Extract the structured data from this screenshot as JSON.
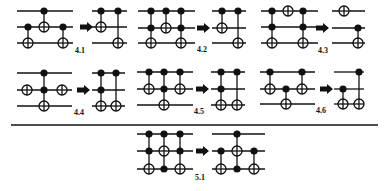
{
  "diagram": {
    "type": "quantum-circuit-identities",
    "colors": {
      "ink": "#111111",
      "background": "#ffffff"
    },
    "divider": {
      "x1": 11,
      "x2": 378,
      "y": 125
    },
    "identities": [
      {
        "id": "4.1",
        "label": "4.1",
        "label_pos": [
          75,
          53
        ],
        "arrow": {
          "x": 80,
          "y": 27
        },
        "lhs": {
          "x1": 17,
          "x2": 73,
          "wires": [
            11,
            27,
            43
          ],
          "gates": [
            {
              "x": 28,
              "controls": [
                27
              ],
              "targets": [
                43
              ],
              "nots": []
            },
            {
              "x": 44,
              "controls": [
                11
              ],
              "targets": [
                27
              ],
              "nots": []
            },
            {
              "x": 63,
              "controls": [
                27
              ],
              "targets": [
                43
              ],
              "nots": []
            }
          ]
        },
        "rhs": {
          "x1": 92,
          "x2": 127,
          "wires": [
            11,
            27,
            43
          ],
          "gates": [
            {
              "x": 101,
              "controls": [
                11
              ],
              "targets": [
                27
              ],
              "nots": []
            },
            {
              "x": 118,
              "controls": [
                11
              ],
              "targets": [
                43
              ],
              "nots": []
            }
          ]
        }
      },
      {
        "id": "4.2",
        "label": "4.2",
        "label_pos": [
          197,
          52
        ],
        "arrow": {
          "x": 197,
          "y": 28
        },
        "lhs": {
          "x1": 138,
          "x2": 195,
          "wires": [
            11,
            28,
            43
          ],
          "gates": [
            {
              "x": 151,
              "controls": [
                11,
                28
              ],
              "targets": [
                43
              ],
              "nots": []
            },
            {
              "x": 166,
              "controls": [
                11
              ],
              "targets": [
                28
              ],
              "nots": []
            },
            {
              "x": 181,
              "controls": [
                11,
                28
              ],
              "targets": [
                43
              ],
              "nots": []
            }
          ]
        },
        "rhs": {
          "x1": 212,
          "x2": 246,
          "wires": [
            11,
            28,
            43
          ],
          "gates": [
            {
              "x": 222,
              "controls": [
                11
              ],
              "targets": [
                28
              ],
              "nots": []
            },
            {
              "x": 238,
              "controls": [
                11
              ],
              "targets": [
                43
              ],
              "nots": []
            }
          ]
        }
      },
      {
        "id": "4.3",
        "label": "4.3",
        "label_pos": [
          318,
          53
        ],
        "arrow": {
          "x": 316,
          "y": 28
        },
        "lhs": {
          "x1": 261,
          "x2": 318,
          "wires": [
            11,
            27,
            43
          ],
          "gates": [
            {
              "x": 272,
              "controls": [
                11,
                27
              ],
              "targets": [
                43
              ],
              "nots": []
            },
            {
              "x": 288,
              "controls": [],
              "targets": [],
              "nots": [
                11
              ]
            },
            {
              "x": 303,
              "controls": [
                11,
                27
              ],
              "targets": [
                43
              ],
              "nots": []
            }
          ]
        },
        "rhs": {
          "x1": 332,
          "x2": 365,
          "wires": [
            11,
            28,
            43
          ],
          "gates": [
            {
              "x": 344,
              "controls": [],
              "targets": [],
              "nots": [
                11
              ]
            },
            {
              "x": 358,
              "controls": [
                28
              ],
              "targets": [
                43
              ],
              "nots": []
            }
          ]
        }
      },
      {
        "id": "4.4",
        "label": "4.4",
        "label_pos": [
          74,
          115
        ],
        "arrow": {
          "x": 77,
          "y": 90
        },
        "lhs": {
          "x1": 17,
          "x2": 72,
          "wires": [
            73,
            90,
            106
          ],
          "gates": [
            {
              "x": 27,
              "controls": [],
              "targets": [],
              "nots": [
                90
              ]
            },
            {
              "x": 44,
              "controls": [
                73,
                90
              ],
              "targets": [
                106
              ],
              "nots": []
            },
            {
              "x": 62,
              "controls": [],
              "targets": [],
              "nots": [
                90
              ]
            }
          ]
        },
        "rhs": {
          "x1": 92,
          "x2": 125,
          "wires": [
            73,
            90,
            106
          ],
          "gates": [
            {
              "x": 101,
              "controls": [
                73,
                90
              ],
              "targets": [
                106
              ],
              "nots": []
            },
            {
              "x": 116,
              "controls": [
                73
              ],
              "targets": [
                106
              ],
              "nots": []
            }
          ]
        }
      },
      {
        "id": "4.5",
        "label": "4.5",
        "label_pos": [
          194,
          114
        ],
        "arrow": {
          "x": 196,
          "y": 89
        },
        "lhs": {
          "x1": 137,
          "x2": 193,
          "wires": [
            72,
            89,
            105
          ],
          "gates": [
            {
              "x": 149,
              "controls": [
                72
              ],
              "targets": [
                89
              ],
              "nots": []
            },
            {
              "x": 164,
              "controls": [
                72,
                89
              ],
              "targets": [
                105
              ],
              "nots": []
            },
            {
              "x": 180,
              "controls": [
                72
              ],
              "targets": [
                89
              ],
              "nots": []
            }
          ]
        },
        "rhs": {
          "x1": 211,
          "x2": 245,
          "wires": [
            72,
            89,
            105
          ],
          "gates": [
            {
              "x": 221,
              "controls": [
                72,
                89
              ],
              "targets": [
                105
              ],
              "nots": []
            },
            {
              "x": 237,
              "controls": [
                72
              ],
              "targets": [
                105
              ],
              "nots": []
            }
          ]
        }
      },
      {
        "id": "4.6",
        "label": "4.6",
        "label_pos": [
          316,
          113
        ],
        "arrow": {
          "x": 320,
          "y": 89
        },
        "lhs": {
          "x1": 260,
          "x2": 315,
          "wires": [
            72,
            89,
            104
          ],
          "gates": [
            {
              "x": 270,
              "controls": [
                72
              ],
              "targets": [
                89
              ],
              "nots": []
            },
            {
              "x": 286,
              "controls": [
                89
              ],
              "targets": [
                104
              ],
              "nots": []
            },
            {
              "x": 302,
              "controls": [
                72
              ],
              "targets": [
                89
              ],
              "nots": []
            }
          ]
        },
        "rhs": {
          "x1": 334,
          "x2": 364,
          "wires": [
            72,
            89,
            104
          ],
          "gates": [
            {
              "x": 343,
              "controls": [
                89
              ],
              "targets": [
                104
              ],
              "nots": []
            },
            {
              "x": 359,
              "controls": [
                72
              ],
              "targets": [
                104
              ],
              "nots": []
            }
          ]
        }
      },
      {
        "id": "5.1",
        "label": "5.1",
        "label_pos": [
          195,
          180
        ],
        "arrow": {
          "x": 196,
          "y": 151
        },
        "lhs": {
          "x1": 137,
          "x2": 193,
          "wires": [
            134,
            151,
            169
          ],
          "gates": [
            {
              "x": 149,
              "controls": [
                134,
                151
              ],
              "targets": [
                169
              ],
              "nots": []
            },
            {
              "x": 164,
              "controls": [
                134,
                169
              ],
              "targets": [
                151
              ],
              "nots": []
            },
            {
              "x": 180,
              "controls": [
                134,
                151
              ],
              "targets": [
                169
              ],
              "nots": []
            }
          ]
        },
        "rhs": {
          "x1": 212,
          "x2": 265,
          "wires": [
            134,
            151,
            169
          ],
          "gates": [
            {
              "x": 221,
              "controls": [
                151
              ],
              "targets": [
                169
              ],
              "nots": []
            },
            {
              "x": 237,
              "controls": [
                134,
                169
              ],
              "targets": [
                151
              ],
              "nots": []
            },
            {
              "x": 254,
              "controls": [
                151
              ],
              "targets": [
                169
              ],
              "nots": []
            }
          ]
        }
      }
    ]
  }
}
